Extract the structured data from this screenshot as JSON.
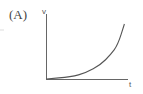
{
  "figure": {
    "panel_label": "(A)",
    "y_axis_label": "v",
    "x_axis_label": "t",
    "colors": {
      "axis": "#666666",
      "curve": "#555555",
      "text": "#444444"
    }
  },
  "chart_data": {
    "type": "line",
    "title": "(A)",
    "xlabel": "t",
    "ylabel": "v",
    "x": [
      0,
      0.3,
      0.48,
      0.66,
      0.78,
      0.87,
      0.95
    ],
    "y": [
      0,
      0.04,
      0.11,
      0.26,
      0.44,
      0.62,
      1.0
    ],
    "grid": false,
    "ticks": false
  }
}
